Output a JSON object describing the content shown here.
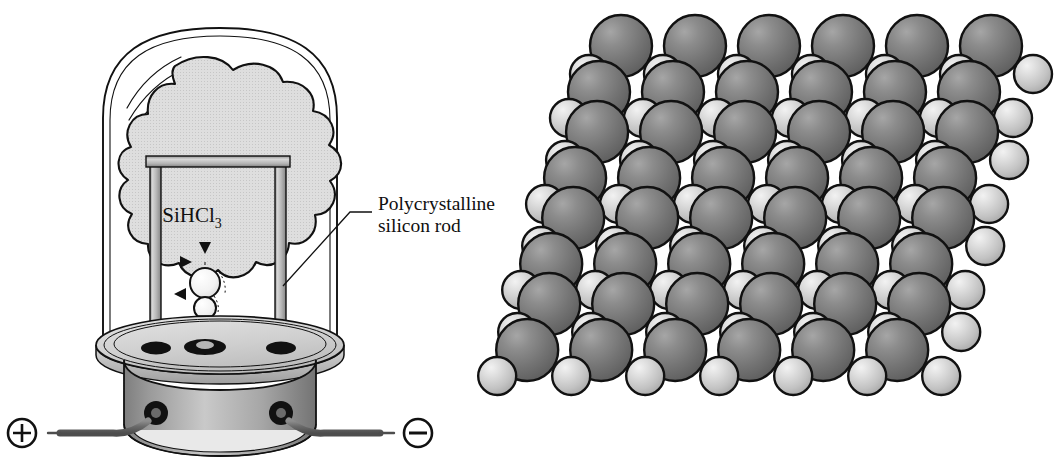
{
  "figure": {
    "panels": [
      {
        "id": "reactor",
        "name": "chemical-vapor-deposition-bell-jar-reactor"
      },
      {
        "id": "lattice",
        "name": "space-filling-crystal-lattice-model"
      }
    ]
  },
  "reactor": {
    "gas_label": "SiHCl",
    "gas_label_subscript": "3",
    "gas_label_full": "SiHCl3",
    "callout": {
      "line1": "Polycrystalline",
      "line2": "silicon rod"
    },
    "terminals": {
      "positive_symbol": "+",
      "negative_symbol": "–",
      "positive_name": "positive-electrode-terminal",
      "negative_name": "negative-electrode-terminal"
    },
    "parts": {
      "bell_jar": "glass-bell-jar",
      "gas_cloud": "silicon-source-gas-cloud",
      "rod_assembly": "inverted-u-silicon-rod",
      "seed_crystal": "growing-silicon-deposit",
      "base_plate": "reactor-base-plate",
      "pedestal": "reactor-pedestal",
      "feedthroughs": "electrode-feedthrough-port"
    },
    "arrow_count": 3
  },
  "lattice": {
    "description": "Close-packed space-filling model of silicon crystal showing alternating large and small atom spheres stacked in sheared layers",
    "atom_types": [
      {
        "name": "large-atom",
        "relative_radius": 31,
        "fill": "#6f6f6f"
      },
      {
        "name": "small-atom",
        "relative_radius": 19,
        "fill": "#c8c8c8"
      }
    ],
    "layers": 4,
    "columns_per_row": 6
  },
  "colors": {
    "outline": "#111111",
    "glass_fill": "#ffffff",
    "cloud_fill": "#d9d9d9",
    "metal_light": "#d2d2d2",
    "metal_mid": "#a8a8a8",
    "metal_dark": "#8a8a8a",
    "socket_black": "#111111",
    "wire_gray": "#6e6e6e",
    "atom_large": "#6f6f6f",
    "atom_small": "#c8c8c8",
    "text": "#101010"
  }
}
